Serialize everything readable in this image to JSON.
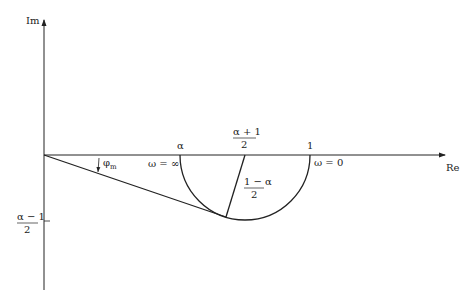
{
  "diagram": {
    "type": "nyquist-plot",
    "axes": {
      "imag_label": "Im",
      "real_label": "Re"
    },
    "real_axis_labels": {
      "alpha": "α",
      "center_num": "α + 1",
      "center_den": "2",
      "one": "1"
    },
    "frequency_labels": {
      "omega_inf": "ω = ∞",
      "omega_zero": "ω = 0"
    },
    "radius_label": {
      "num": "1 − α",
      "den": "2"
    },
    "imag_tick_label": {
      "num": "α − 1",
      "den": "2"
    },
    "angle_label": {
      "symbol": "φ",
      "subscript": "m"
    },
    "colors": {
      "line": "#222222",
      "background": "#ffffff"
    }
  }
}
